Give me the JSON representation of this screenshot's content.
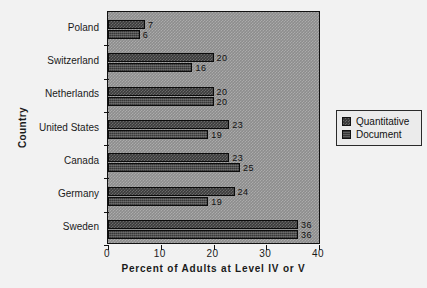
{
  "chart_data": {
    "type": "bar",
    "orientation": "horizontal",
    "title": "",
    "xlabel": "Percent of Adults at Level IV or V",
    "ylabel": "Country",
    "xlim": [
      0,
      40
    ],
    "xticks": [
      0,
      10,
      20,
      30,
      40
    ],
    "xticklabels": [
      "0",
      "10",
      "20",
      "30",
      "40"
    ],
    "grid": false,
    "legend_position": "right-outside",
    "categories": [
      "Poland",
      "Switzerland",
      "Netherlands",
      "United States",
      "Canada",
      "Germany",
      "Sweden"
    ],
    "series": [
      {
        "name": "Quantitative",
        "values": [
          7,
          20,
          20,
          23,
          23,
          24,
          36
        ]
      },
      {
        "name": "Document",
        "values": [
          6,
          16,
          20,
          19,
          25,
          19,
          36
        ]
      }
    ],
    "datalabels": {
      "Poland": [
        "7",
        "6"
      ],
      "Switzerland": [
        "20",
        "16"
      ],
      "Netherlands": [
        "20",
        "20"
      ],
      "United States": [
        "23",
        "19"
      ],
      "Canada": [
        "23",
        "25"
      ],
      "Germany": [
        "24",
        "19"
      ],
      "Sweden": [
        "36",
        "36"
      ]
    },
    "colors": {
      "plot_background": "#8d8d8d",
      "figure_background": "#f2f2f2",
      "quantitative": "#3b3b3b",
      "document": "#383838",
      "axis": "#111111",
      "legend_background": "#ebebeb"
    }
  },
  "legend": {
    "entries": [
      {
        "label": "Quantitative",
        "key": "quantitative"
      },
      {
        "label": "Document",
        "key": "document"
      }
    ]
  }
}
